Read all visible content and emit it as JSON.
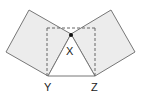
{
  "diagram": {
    "labels": {
      "x": "X",
      "y": "Y",
      "z": "Z"
    },
    "colors": {
      "square_fill": "#ececec",
      "stroke": "#777777",
      "dashed": "#666666",
      "point": "#111111"
    },
    "shapes": [
      {
        "name": "left-square",
        "points": "29,10 6,52 48,76 71,34"
      },
      {
        "name": "right-square",
        "points": "111,10 135,52 95,76 71,34"
      },
      {
        "name": "triangle",
        "points": "71,34 48,76 95,76"
      },
      {
        "name": "dashed-rectangle",
        "x": 47,
        "y": 28,
        "w": 48,
        "h": 48
      }
    ]
  }
}
